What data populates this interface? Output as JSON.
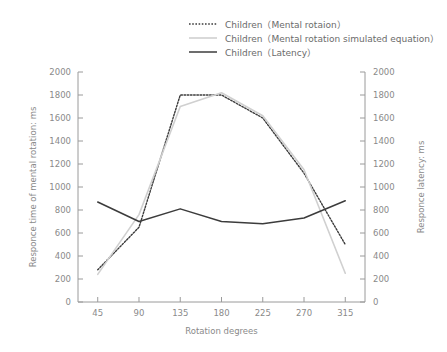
{
  "chart_data": {
    "type": "line",
    "title": "",
    "xlabel": "Rotation degrees",
    "ylabel": "Responce time of mental rotation: ms",
    "y2label": "Responce latency: ms",
    "x": [
      45,
      90,
      135,
      180,
      225,
      270,
      315
    ],
    "xtick_labels": [
      "45",
      "90",
      "135",
      "180",
      "225",
      "270",
      "315"
    ],
    "ytick_labels": [
      "0",
      "200",
      "400",
      "600",
      "800",
      "1000",
      "1200",
      "1400",
      "1600",
      "1800",
      "2000"
    ],
    "y2tick_labels": [
      "0",
      "200",
      "400",
      "600",
      "800",
      "1000",
      "1200",
      "1400",
      "1600",
      "1800",
      "2000"
    ],
    "ylim": [
      0,
      2000
    ],
    "y2lim": [
      0,
      2000
    ],
    "grid": false,
    "legend_position": "top-center",
    "series": [
      {
        "name": "Children（Mental rotaion）",
        "style": "dotted",
        "color": "#3c3c3c",
        "axis": "left",
        "values": [
          280,
          650,
          1800,
          1800,
          1600,
          1120,
          500
        ]
      },
      {
        "name": "Children（Mental rotation simulated equation）",
        "style": "solid-light",
        "color": "#d0d0d0",
        "axis": "left",
        "values": [
          240,
          760,
          1700,
          1820,
          1620,
          1150,
          250
        ]
      },
      {
        "name": "Children（Latency）",
        "style": "solid",
        "color": "#3c3c3c",
        "axis": "right",
        "values": [
          870,
          700,
          810,
          700,
          680,
          730,
          880
        ]
      }
    ]
  },
  "legend": {
    "items": [
      {
        "label": "Children（Mental rotaion）"
      },
      {
        "label": "Children（Mental rotation simulated equation）"
      },
      {
        "label": "Children（Latency）"
      }
    ]
  },
  "axes": {
    "x_title": "Rotation degrees",
    "y_left_title": "Responce time of mental rotation: ms",
    "y_right_title": "Responce latency: ms"
  }
}
